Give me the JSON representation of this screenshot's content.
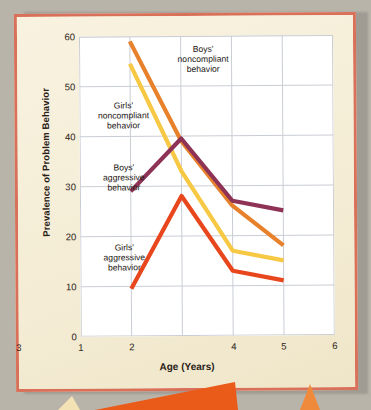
{
  "chart_data": {
    "type": "line",
    "title": "",
    "xlabel": "Age (Years)",
    "ylabel": "Prevalence of Problem Behavior",
    "x": [
      2,
      3,
      4,
      5
    ],
    "xlim": [
      1,
      6
    ],
    "ylim": [
      0,
      60
    ],
    "xticks": [
      "1",
      "2",
      "3",
      "4",
      "5",
      "6"
    ],
    "yticks": [
      "0",
      "10",
      "20",
      "30",
      "40",
      "50",
      "60"
    ],
    "grid": true,
    "legend_position": "inline-annotations",
    "series": [
      {
        "name": "Boys' noncompliant behavior",
        "color": "#e8812b",
        "values": [
          59,
          39,
          26,
          18
        ]
      },
      {
        "name": "Girls' noncompliant behavior",
        "color": "#f6c844",
        "values": [
          54.5,
          33,
          17,
          15
        ]
      },
      {
        "name": "Boys' aggressive behavior",
        "color": "#8e3356",
        "values": [
          29,
          39.5,
          27,
          25
        ]
      },
      {
        "name": "Girls' aggressive behavior",
        "color": "#e8461d",
        "values": [
          9.5,
          28,
          13,
          11
        ]
      }
    ],
    "annotations": [
      {
        "text": "Boys'\nnoncompliant\nbehavior",
        "x": 155,
        "y": 30
      },
      {
        "text": "Girls'\nnoncompliant\nbehavior",
        "x": 60,
        "y": 88
      },
      {
        "text": "Boys'\naggressive\nbehavior",
        "x": 60,
        "y": 148
      },
      {
        "text": "Girls'\naggressive\nbehavior",
        "x": 58,
        "y": 228
      }
    ]
  },
  "colors": {
    "paper": "#f6efd9",
    "paper_border": "#d9705a",
    "plot_bg": "#ffffff",
    "grid": "#c9cdd4",
    "axis_text": "#2a2118",
    "page_bg": "#b8b4aa",
    "deco_orange": "#ea5a19"
  }
}
